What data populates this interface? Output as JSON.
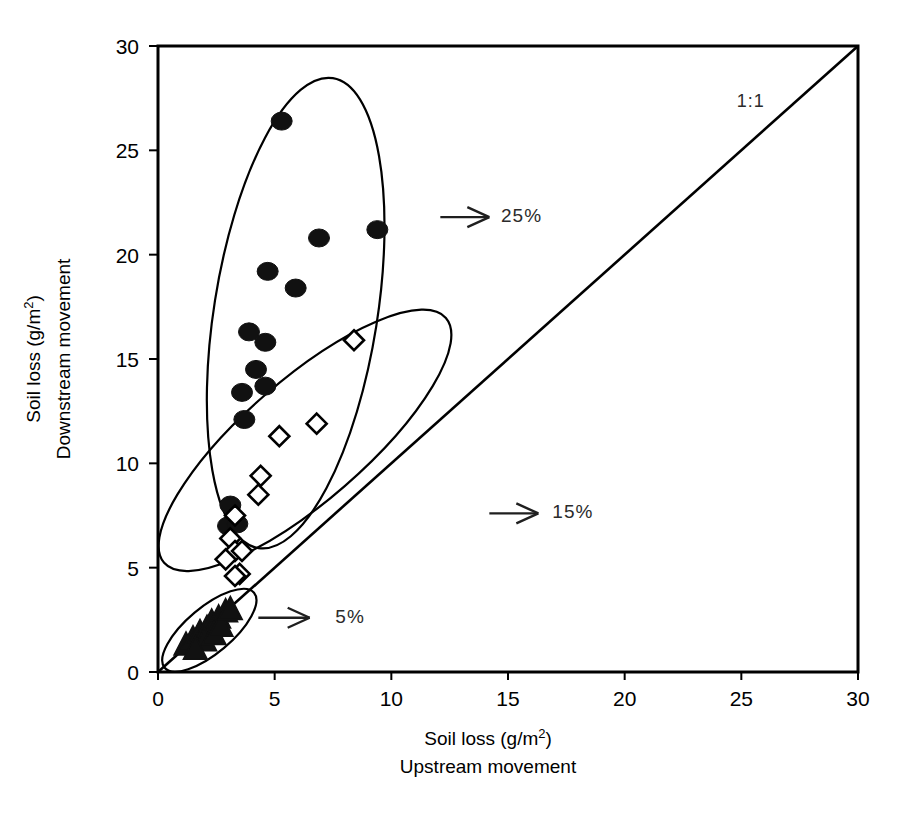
{
  "chart_data": {
    "type": "scatter",
    "title": "",
    "xlabel": "Soil loss (g/m2)",
    "xlabel_line1": "Soil loss (g/m",
    "xlabel_sup": "2",
    "xlabel_line1_end": ")",
    "xlabel_line2": "Upstream movement",
    "ylabel_line1": "Soil loss (g/m",
    "ylabel_sup": "2",
    "ylabel_line1_end": ")",
    "ylabel_line2": "Downstream movement",
    "xlim": [
      0,
      30
    ],
    "ylim": [
      0,
      30
    ],
    "xticks": [
      0,
      5,
      10,
      15,
      20,
      25,
      30
    ],
    "yticks": [
      0,
      5,
      10,
      15,
      20,
      25,
      30
    ],
    "xtick_labels": [
      "0",
      "5",
      "10",
      "15",
      "20",
      "25",
      "30"
    ],
    "ytick_labels": [
      "0",
      "5",
      "10",
      "15",
      "20",
      "25",
      "30"
    ],
    "grid": false,
    "legend_position": "none",
    "reference_line": {
      "name": "one-to-one-line",
      "label": "1:1",
      "from": [
        0,
        0
      ],
      "to": [
        30,
        30
      ],
      "label_at": [
        25.4,
        27.1
      ]
    },
    "series": [
      {
        "name": "25% slope",
        "marker": "filled-circle",
        "color": "#000000",
        "points": [
          [
            5.3,
            26.4
          ],
          [
            6.9,
            20.8
          ],
          [
            9.4,
            21.2
          ],
          [
            4.7,
            19.2
          ],
          [
            5.9,
            18.4
          ],
          [
            3.9,
            16.3
          ],
          [
            4.6,
            15.8
          ],
          [
            4.2,
            14.5
          ],
          [
            3.6,
            13.4
          ],
          [
            4.6,
            13.7
          ],
          [
            3.7,
            12.1
          ],
          [
            3.1,
            8.0
          ],
          [
            3.0,
            7.0
          ],
          [
            3.4,
            7.1
          ]
        ]
      },
      {
        "name": "15% slope",
        "marker": "open-diamond",
        "color": "#000000",
        "points": [
          [
            8.4,
            15.9
          ],
          [
            6.8,
            11.9
          ],
          [
            5.2,
            11.3
          ],
          [
            4.4,
            9.4
          ],
          [
            4.3,
            8.5
          ],
          [
            3.3,
            7.5
          ],
          [
            3.1,
            6.4
          ],
          [
            3.3,
            5.8
          ],
          [
            3.6,
            5.8
          ],
          [
            2.9,
            5.4
          ],
          [
            3.5,
            4.7
          ],
          [
            3.3,
            4.6
          ]
        ]
      },
      {
        "name": "5% slope",
        "marker": "filled-triangle",
        "color": "#000000",
        "points": [
          [
            1.2,
            1.3
          ],
          [
            1.5,
            1.6
          ],
          [
            1.8,
            1.9
          ],
          [
            2.1,
            2.1
          ],
          [
            2.3,
            2.4
          ],
          [
            2.6,
            2.6
          ],
          [
            2.9,
            2.9
          ],
          [
            2.0,
            1.5
          ],
          [
            2.4,
            1.8
          ],
          [
            1.6,
            1.1
          ],
          [
            2.7,
            2.2
          ],
          [
            3.1,
            3.0
          ]
        ]
      }
    ],
    "annotations": [
      {
        "name": "annotation-25-percent",
        "label": "25%",
        "arrow_from": [
          12.1,
          21.8
        ],
        "arrow_to": [
          14.2,
          21.8
        ],
        "label_at": [
          14.7,
          21.9
        ]
      },
      {
        "name": "annotation-15-percent",
        "label": "15%",
        "arrow_from": [
          14.2,
          7.6
        ],
        "arrow_to": [
          16.3,
          7.6
        ],
        "label_at": [
          16.9,
          7.7
        ]
      },
      {
        "name": "annotation-5-percent",
        "label": "5%",
        "arrow_from": [
          4.3,
          2.6
        ],
        "arrow_to": [
          6.5,
          2.6
        ],
        "label_at": [
          7.6,
          2.7
        ]
      }
    ],
    "groupings": [
      {
        "name": "ellipse-25-percent",
        "cx": 5.9,
        "cy": 17.2,
        "rx": 3.5,
        "ry": 11.4,
        "rotation_deg": 9
      },
      {
        "name": "ellipse-15-percent",
        "cx": 6.3,
        "cy": 11.1,
        "rx": 8.0,
        "ry": 2.9,
        "rotation_deg": -41
      },
      {
        "name": "ellipse-5-percent",
        "cx": 2.2,
        "cy": 2.0,
        "rx": 2.5,
        "ry": 1.1,
        "rotation_deg": -40
      }
    ]
  }
}
